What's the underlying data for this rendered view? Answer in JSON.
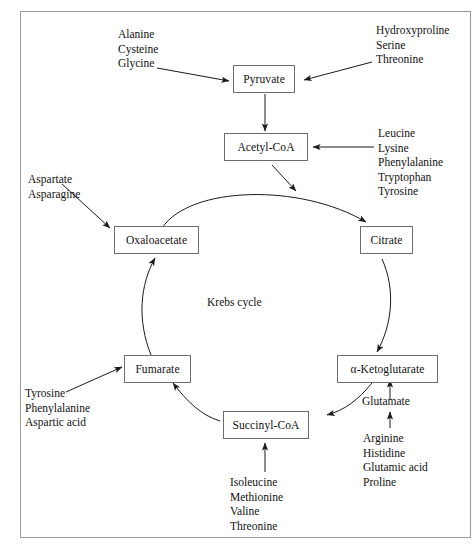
{
  "diagram": {
    "center_label": "Krebs cycle",
    "frame_color": "#9a9a9a",
    "node_border_color": "#6d6d6d",
    "line_color": "#1a1a1a",
    "nodes": {
      "pyruvate": "Pyruvate",
      "acetyl_coa": "Acetyl-CoA",
      "oxaloacetate": "Oxaloacetate",
      "citrate": "Citrate",
      "fumarate": "Fumarate",
      "alpha_ketoglutarate": "α-Ketoglutarate",
      "succinyl_coa": "Succinyl-CoA",
      "glutamate": "Glutamate"
    },
    "labels": {
      "to_pyruvate_left": {
        "lines": [
          "Alanine",
          "Cysteine",
          "Glycine"
        ]
      },
      "to_pyruvate_right": {
        "lines": [
          "Hydroxyproline",
          "Serine",
          "Threonine"
        ]
      },
      "to_acetyl_coa_right": {
        "lines": [
          "Leucine",
          "Lysine",
          "Phenylalanine",
          "Tryptophan",
          "Tyrosine"
        ]
      },
      "to_oxaloacetate_left": {
        "lines": [
          "Aspartate",
          "Asparagine"
        ]
      },
      "to_fumarate_left": {
        "lines": [
          "Tyrosine",
          "Phenylalanine",
          "Aspartic acid"
        ]
      },
      "to_glutamate_below": {
        "lines": [
          "Arginine",
          "Histidine",
          "Glutamic acid",
          "Proline"
        ]
      },
      "to_succinyl_coa_below": {
        "lines": [
          "Isoleucine",
          "Methionine",
          "Valine",
          "Threonine"
        ]
      }
    }
  }
}
